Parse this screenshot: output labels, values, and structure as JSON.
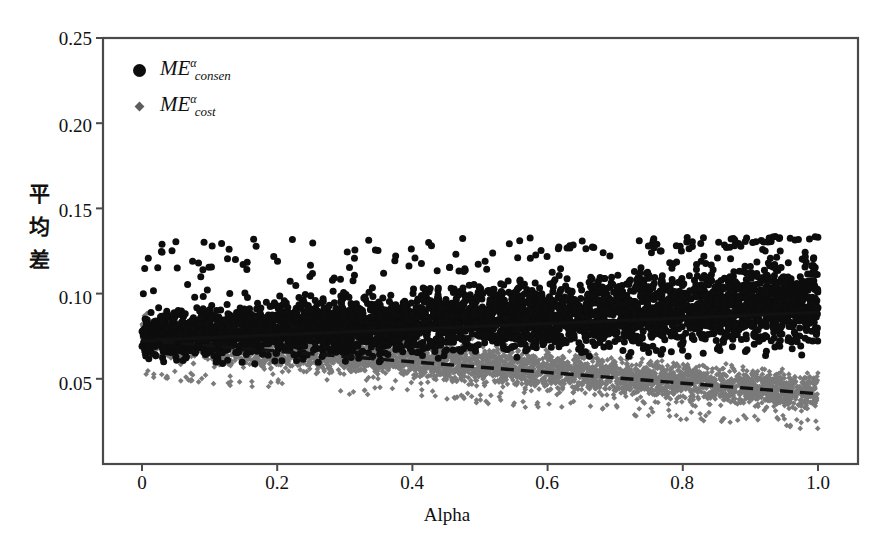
{
  "chart_data": {
    "type": "scatter",
    "title": "",
    "xlabel": "Alpha",
    "ylabel": "平均差",
    "xlim": [
      0.0,
      1.0
    ],
    "ylim": [
      0.0,
      0.25
    ],
    "xticks": [
      "0",
      "0.2",
      "0.4",
      "0.6",
      "0.8",
      "1.0"
    ],
    "xtick_values": [
      0.0,
      0.2,
      0.4,
      0.6,
      0.8,
      1.0
    ],
    "yticks": [
      "0.05",
      "0.10",
      "0.15",
      "0.20",
      "0.25"
    ],
    "ytick_values": [
      0.05,
      0.1,
      0.15,
      0.2,
      0.25
    ],
    "grid": false,
    "legend_position": "top-left",
    "series": [
      {
        "name": "ME_consen_alpha",
        "label_base": "ME",
        "label_sup": "α",
        "label_sub": "consen",
        "marker": "circle",
        "marker_size": 7,
        "color": "#0d0d0d",
        "point_count": 4200,
        "band_low_at_x0": 0.055,
        "band_high_at_x0": 0.094,
        "band_low_at_x1": 0.058,
        "band_high_at_x1": 0.132,
        "outlier_max": 0.134,
        "trend": {
          "style": "solid",
          "color": "#111111",
          "y_at_x0": 0.0725,
          "y_at_x1": 0.089,
          "slope": 0.0165,
          "intercept": 0.0725
        }
      },
      {
        "name": "ME_cost_alpha",
        "label_base": "ME",
        "label_sup": "α",
        "label_sub": "cost",
        "marker": "diamond",
        "marker_size": 4,
        "color": "#7a7a7a",
        "point_count": 4200,
        "band_low_at_x0": 0.056,
        "band_high_at_x0": 0.093,
        "band_low_at_x1": 0.026,
        "band_high_at_x1": 0.057,
        "outlier_min": 0.024,
        "trend": {
          "style": "dashed",
          "color": "#111111",
          "y_at_x0": 0.0725,
          "y_at_x1": 0.0412,
          "slope": -0.0313,
          "intercept": 0.0725
        }
      }
    ]
  },
  "axes": {
    "frame_color": "#4a4a4a",
    "background": "#ffffff"
  }
}
